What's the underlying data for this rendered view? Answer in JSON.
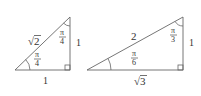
{
  "diagram": {
    "triangle_45": {
      "hypotenuse": "2",
      "hyp_sqrt": "√",
      "vertical_side": "1",
      "horizontal_side": "1",
      "angle_bottom": {
        "num": "π",
        "den": "4"
      },
      "angle_top": {
        "num": "π",
        "den": "4"
      }
    },
    "triangle_30_60": {
      "hypotenuse": "2",
      "vertical_side": "1",
      "horizontal_side": "3",
      "horizontal_sqrt": "√",
      "angle_bottom": {
        "num": "π",
        "den": "6"
      },
      "angle_top": {
        "num": "π",
        "den": "3"
      }
    },
    "line_color": "#555555"
  }
}
